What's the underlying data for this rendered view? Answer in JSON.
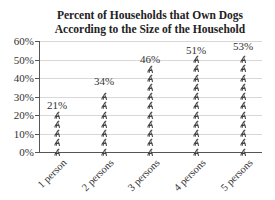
{
  "chart_data": {
    "type": "bar",
    "style": "pictograph",
    "pictogram": "dog-icon",
    "title": "Percent of Households that Own Dogs According to the Size of the Household",
    "title_lines": [
      "Percent of Households that Own Dogs",
      "According to the Size of the Household"
    ],
    "categories": [
      "1 person",
      "2 persons",
      "3 persons",
      "4 persons",
      "5 persons"
    ],
    "values": [
      21,
      34,
      46,
      51,
      53
    ],
    "data_labels": [
      "21%",
      "34%",
      "46%",
      "51%",
      "53%"
    ],
    "xlabel": "",
    "ylabel": "",
    "ylim": [
      0,
      60
    ],
    "yticks": [
      "0%",
      "10%",
      "20%",
      "30%",
      "40%",
      "50%",
      "60%"
    ],
    "grid": true,
    "legend": null
  }
}
